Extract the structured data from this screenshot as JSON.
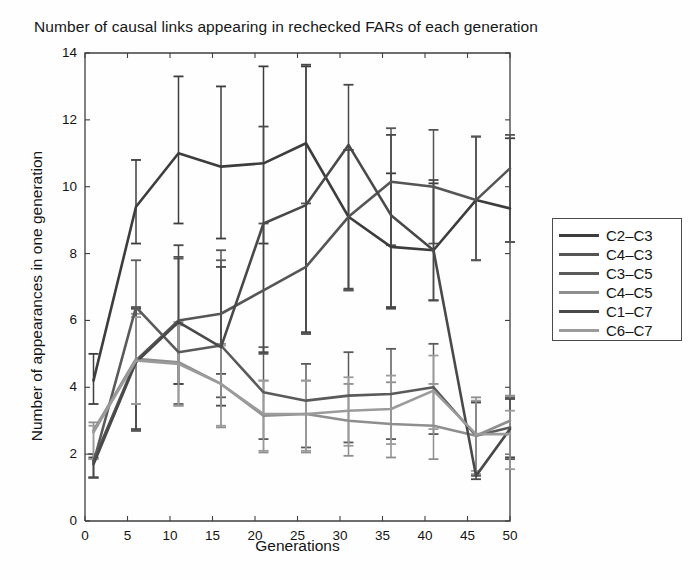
{
  "chart_data": {
    "type": "line",
    "title": "Number of causal links appearing in rechecked FARs of each generation",
    "xlabel": "Generations",
    "ylabel": "Number of appearances in one generation",
    "xlim": [
      0,
      50
    ],
    "ylim": [
      0,
      14
    ],
    "xticks": [
      0,
      5,
      10,
      15,
      20,
      25,
      30,
      35,
      40,
      45,
      50
    ],
    "yticks": [
      0,
      2,
      4,
      6,
      8,
      10,
      12,
      14
    ],
    "grid": false,
    "legend_position": "right-outside",
    "errorbars": true,
    "x": [
      1,
      6,
      11,
      16,
      21,
      26,
      31,
      36,
      41,
      46,
      50
    ],
    "series": [
      {
        "name": "C2-C3",
        "color": "#3d3d3d",
        "values": [
          4.2,
          9.4,
          11.0,
          10.6,
          10.7,
          11.3,
          9.1,
          8.2,
          8.1,
          9.6,
          9.35
        ],
        "err_low": [
          0.7,
          1.1,
          2.1,
          2.15,
          2.4,
          5.7,
          2.2,
          1.8,
          1.5,
          1.8,
          1.0
        ],
        "err_high": [
          0.8,
          1.4,
          2.3,
          2.4,
          2.9,
          2.3,
          2.0,
          2.2,
          2.0,
          1.9,
          2.1
        ]
      },
      {
        "name": "C4-C3",
        "color": "#555555",
        "values": [
          1.8,
          4.8,
          6.0,
          6.2,
          6.9,
          7.6,
          9.1,
          10.15,
          10.0,
          9.6,
          10.55
        ],
        "err_low": [
          0.5,
          2.1,
          1.9,
          1.8,
          1.9,
          2.0,
          2.2,
          1.9,
          1.7,
          1.8,
          2.2
        ],
        "err_high": [
          0.2,
          1.6,
          1.9,
          1.9,
          2.0,
          1.9,
          2.0,
          1.6,
          1.7,
          1.9,
          1.0
        ]
      },
      {
        "name": "C3-C5",
        "color": "#5a5a5a",
        "values": [
          1.75,
          6.4,
          5.05,
          5.25,
          3.85,
          3.6,
          3.75,
          3.8,
          4.0,
          2.55,
          2.8
        ],
        "err_low": [
          0.45,
          3.7,
          1.55,
          1.55,
          1.4,
          1.4,
          1.4,
          1.35,
          1.4,
          1.2,
          0.95
        ],
        "err_high": [
          0.25,
          1.4,
          2.8,
          2.55,
          1.35,
          1.1,
          1.3,
          1.35,
          1.3,
          1.0,
          0.9
        ]
      },
      {
        "name": "C4-C5",
        "color": "#8e8e8e",
        "values": [
          2.7,
          4.85,
          4.75,
          4.1,
          3.15,
          3.2,
          3.0,
          2.9,
          2.85,
          2.55,
          3.0
        ],
        "err_low": [
          0.85,
          1.35,
          1.3,
          1.3,
          1.1,
          1.15,
          1.05,
          1.0,
          1.0,
          1.15,
          1.1
        ],
        "err_high": [
          0.25,
          1.35,
          1.2,
          1.2,
          1.05,
          1.0,
          1.1,
          1.25,
          1.25,
          1.15,
          0.75
        ]
      },
      {
        "name": "C1-C7",
        "color": "#494949",
        "values": [
          1.7,
          4.75,
          5.95,
          5.2,
          8.9,
          9.45,
          11.25,
          9.15,
          8.1,
          1.35,
          2.75
        ],
        "err_low": [
          0.4,
          2.0,
          1.85,
          1.75,
          3.85,
          3.8,
          4.3,
          2.8,
          1.5,
          0.1,
          0.85
        ],
        "err_high": [
          0.2,
          1.6,
          2.3,
          2.4,
          2.9,
          4.2,
          1.8,
          2.4,
          2.1,
          2.2,
          0.9
        ]
      },
      {
        "name": "C6-C7",
        "color": "#9b9b9b",
        "values": [
          2.65,
          4.8,
          4.7,
          4.1,
          3.2,
          3.2,
          3.3,
          3.35,
          3.9,
          2.6,
          2.6
        ],
        "err_low": [
          0.8,
          1.3,
          1.25,
          1.25,
          1.1,
          1.1,
          1.05,
          1.05,
          1.15,
          1.1,
          1.05
        ],
        "err_high": [
          0.2,
          1.3,
          1.15,
          1.15,
          1.0,
          1.0,
          1.0,
          1.0,
          1.05,
          1.0,
          0.7
        ]
      }
    ]
  },
  "legend": {
    "entries": [
      {
        "label": "C2-C3"
      },
      {
        "label": "C4-C3"
      },
      {
        "label": "C3-C5"
      },
      {
        "label": "C4-C5"
      },
      {
        "label": "C1-C7"
      },
      {
        "label": "C6-C7"
      }
    ]
  },
  "axes": {
    "x_tick_labels": [
      "0",
      "5",
      "10",
      "15",
      "20",
      "25",
      "30",
      "35",
      "40",
      "45",
      "50"
    ],
    "y_tick_labels": [
      "0",
      "2",
      "4",
      "6",
      "8",
      "10",
      "12",
      "14"
    ]
  },
  "colors": {
    "axis": "#3f3f3f",
    "background": "#fefefe",
    "text": "#151515"
  }
}
